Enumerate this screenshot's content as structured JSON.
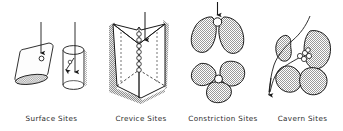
{
  "figure": {
    "background_color": "#ffffff",
    "ink_color": "#1a1a1a",
    "blob_fill_color": "#a8a8a8",
    "shadow_color": "#b5b5b5",
    "sphere_color": "#ffffff"
  },
  "panels": [
    {
      "id": "surface",
      "label": "Surface Sites",
      "icons": [
        "tilted-cylinder-icon",
        "upright-cylinder-icon",
        "down-arrow-icon",
        "up-arrow-icon",
        "diagonal-arrow-icon",
        "adsorbed-sphere-icon"
      ],
      "sphere_count": 2,
      "arrow_count": 3
    },
    {
      "id": "crevice",
      "label": "Crevice Sites",
      "icons": [
        "open-crevice-block-icon",
        "down-arrow-icon",
        "sphere-chain-icon"
      ],
      "sphere_count": 7,
      "arrow_count": 1
    },
    {
      "id": "constriction",
      "label": "Constriction Sites",
      "icons": [
        "two-lobe-grain-icon",
        "three-lobe-grain-icon",
        "down-arrow-icon",
        "trapped-sphere-icon"
      ],
      "sphere_count": 2,
      "arrow_count": 1,
      "views": [
        "two-grain-side-view",
        "three-grain-plan-view"
      ]
    },
    {
      "id": "cavern",
      "label": "Cavern Sites",
      "icons": [
        "grain-cluster-icon",
        "diffusion-path-icon",
        "sphere-cluster-icon",
        "down-left-arrow-icon"
      ],
      "sphere_count": 5,
      "arrow_count": 1,
      "grain_count": 4
    }
  ]
}
